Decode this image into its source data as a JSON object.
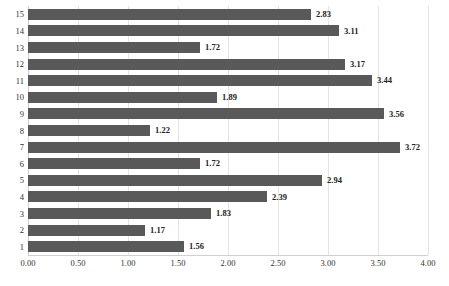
{
  "chart_data": {
    "type": "bar",
    "orientation": "horizontal",
    "title": "",
    "subtitle": "",
    "xlabel": "",
    "ylabel": "",
    "xlim": [
      0,
      4
    ],
    "ylim": [
      0.5,
      15.5
    ],
    "grid": true,
    "legend": null,
    "legend_position": "none",
    "bar_color": "#595959",
    "gridline_color": "#E4E4E4",
    "data_labels": true,
    "data_label_format": "0.00",
    "xticks": [
      0,
      0.5,
      1,
      1.5,
      2,
      2.5,
      3,
      3.5,
      4
    ],
    "xtick_labels": [
      "0.00",
      "0.50",
      "1.00",
      "1.50",
      "2.00",
      "2.50",
      "3.00",
      "3.50",
      "4.00"
    ],
    "categories": [
      "1",
      "2",
      "3",
      "4",
      "5",
      "6",
      "7",
      "8",
      "9",
      "10",
      "11",
      "12",
      "13",
      "14",
      "15"
    ],
    "values": [
      1.56,
      1.17,
      1.83,
      2.39,
      2.94,
      1.72,
      3.72,
      1.22,
      3.56,
      1.89,
      3.44,
      3.17,
      1.72,
      3.11,
      2.83
    ],
    "value_labels": [
      "1.56",
      "1.17",
      "1.83",
      "2.39",
      "2.94",
      "1.72",
      "3.72",
      "1.22",
      "3.56",
      "1.89",
      "3.44",
      "3.17",
      "1.72",
      "3.11",
      "2.83"
    ],
    "bars_top_to_bottom": [
      {
        "category": "15",
        "value": 2.83,
        "label": "2.83"
      },
      {
        "category": "14",
        "value": 3.11,
        "label": "3.11"
      },
      {
        "category": "13",
        "value": 1.72,
        "label": "1.72"
      },
      {
        "category": "12",
        "value": 3.17,
        "label": "3.17"
      },
      {
        "category": "11",
        "value": 3.44,
        "label": "3.44"
      },
      {
        "category": "10",
        "value": 1.89,
        "label": "1.89"
      },
      {
        "category": "9",
        "value": 3.56,
        "label": "3.56"
      },
      {
        "category": "8",
        "value": 1.22,
        "label": "1.22"
      },
      {
        "category": "7",
        "value": 3.72,
        "label": "3.72"
      },
      {
        "category": "6",
        "value": 1.72,
        "label": "1.72"
      },
      {
        "category": "5",
        "value": 2.94,
        "label": "2.94"
      },
      {
        "category": "4",
        "value": 2.39,
        "label": "2.39"
      },
      {
        "category": "3",
        "value": 1.83,
        "label": "1.83"
      },
      {
        "category": "2",
        "value": 1.17,
        "label": "1.17"
      },
      {
        "category": "1",
        "value": 1.56,
        "label": "1.56"
      }
    ]
  }
}
